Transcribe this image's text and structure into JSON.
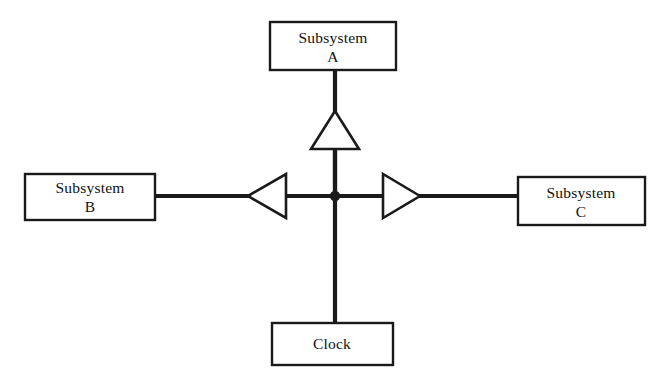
{
  "diagram": {
    "background_color": "#ffffff",
    "line_color": "#1a1a1a",
    "boxes": [
      {
        "id": "subsystem-a",
        "line1": "Subsystem",
        "line2": "A",
        "x": 270,
        "y": 22,
        "w": 126,
        "h": 48
      },
      {
        "id": "subsystem-b",
        "line1": "Subsystem",
        "line2": "B",
        "x": 25,
        "y": 174,
        "w": 130,
        "h": 46
      },
      {
        "id": "subsystem-c",
        "line1": "Subsystem",
        "line2": "C",
        "x": 518,
        "y": 177,
        "w": 127,
        "h": 48
      },
      {
        "id": "clock",
        "line1": "Clock",
        "line2": "",
        "x": 272,
        "y": 323,
        "w": 121,
        "h": 42
      }
    ],
    "buffers": [
      {
        "id": "buffer-up",
        "direction": "up",
        "label": ""
      },
      {
        "id": "buffer-left",
        "direction": "left",
        "label": ""
      },
      {
        "id": "buffer-right",
        "direction": "right",
        "label": ""
      }
    ],
    "junction": {
      "x": 335,
      "y": 196,
      "radius": 5
    }
  }
}
